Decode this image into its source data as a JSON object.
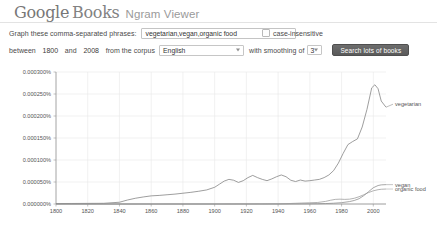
{
  "header": {
    "logo_google": "Google",
    "logo_books": "Books",
    "subtitle": "Ngram Viewer"
  },
  "query_row": {
    "label": "Graph these comma-separated phrases:",
    "input_value": "vegetarian,vegan,organic food",
    "input_placeholder": "",
    "case_insensitive_label": "case-insensitive",
    "case_insensitive_checked": false
  },
  "options_row": {
    "between_label": "between",
    "start_year": "1800",
    "and_label": "and",
    "end_year": "2008",
    "corpus_label": "from the corpus",
    "corpus_value": "English",
    "smoothing_label": "with smoothing of",
    "smoothing_value": "3",
    "search_button": "Search lots of books"
  },
  "chart_data": {
    "type": "line",
    "title": "",
    "xlabel": "",
    "ylabel": "",
    "grid": true,
    "legend_position": "right-inline",
    "xlim": [
      1800,
      2008
    ],
    "ylim": [
      0,
      0.0003
    ],
    "xticks": [
      1800,
      1820,
      1840,
      1860,
      1880,
      1900,
      1920,
      1940,
      1960,
      1980,
      2000
    ],
    "ytick_labels": [
      "0.000000%",
      "0.000050%",
      "0.000100%",
      "0.000150%",
      "0.000200%",
      "0.000250%",
      "0.000300%"
    ],
    "yticks": [
      0.0,
      5e-05,
      0.0001,
      0.00015,
      0.0002,
      0.00025,
      0.0003
    ],
    "series": [
      {
        "name": "vegetarian",
        "color": "#7d7d7d",
        "x": [
          1800,
          1810,
          1820,
          1830,
          1840,
          1845,
          1850,
          1855,
          1860,
          1865,
          1870,
          1875,
          1880,
          1885,
          1890,
          1895,
          1900,
          1903,
          1906,
          1909,
          1912,
          1915,
          1918,
          1921,
          1924,
          1927,
          1930,
          1933,
          1936,
          1939,
          1942,
          1945,
          1948,
          1951,
          1954,
          1957,
          1960,
          1963,
          1966,
          1969,
          1972,
          1975,
          1978,
          1981,
          1984,
          1987,
          1990,
          1993,
          1996,
          1999,
          2001,
          2003,
          2005,
          2008
        ],
        "y": [
          1e-06,
          1.2e-06,
          1.4e-06,
          1.6e-06,
          4e-06,
          9e-06,
          1.3e-05,
          1.6e-05,
          1.85e-05,
          1.95e-05,
          2.1e-05,
          2.25e-05,
          2.45e-05,
          2.65e-05,
          2.9e-05,
          3.2e-05,
          3.8e-05,
          4.5e-05,
          5.2e-05,
          5.6e-05,
          5.4e-05,
          4.9e-05,
          5.3e-05,
          6e-05,
          6.5e-05,
          6e-05,
          5.6e-05,
          5.3e-05,
          5.7e-05,
          6.2e-05,
          6.6e-05,
          6.2e-05,
          5.4e-05,
          5.1e-05,
          5.45e-05,
          5.2e-05,
          5.3e-05,
          5.45e-05,
          5.6e-05,
          6e-05,
          6.6e-05,
          7.6e-05,
          9.3e-05,
          0.000115,
          0.000135,
          0.000142,
          0.000148,
          0.000175,
          0.000215,
          0.000264,
          0.000271,
          0.000262,
          0.000234,
          0.00022
        ]
      },
      {
        "name": "vegan",
        "color": "#8a8a8a",
        "x": [
          1800,
          1900,
          1940,
          1950,
          1960,
          1965,
          1970,
          1975,
          1980,
          1985,
          1988,
          1991,
          1994,
          1997,
          2000,
          2003,
          2005,
          2008
        ],
        "y": [
          0.0,
          0.0,
          1e-07,
          2e-07,
          4e-07,
          6e-07,
          1e-06,
          1.8e-06,
          3e-06,
          5.5e-06,
          8e-06,
          1.2e-05,
          1.9e-05,
          2.8e-05,
          3.7e-05,
          4.2e-05,
          4.35e-05,
          4.4e-05
        ]
      },
      {
        "name": "organic food",
        "color": "#9a9a9a",
        "x": [
          1800,
          1900,
          1930,
          1940,
          1945,
          1950,
          1955,
          1960,
          1965,
          1970,
          1973,
          1976,
          1979,
          1982,
          1985,
          1988,
          1991,
          1994,
          1997,
          2000,
          2003,
          2005,
          2008
        ],
        "y": [
          0.0,
          1e-07,
          2e-07,
          4e-07,
          8e-07,
          1.5e-06,
          2.2e-06,
          2.8e-06,
          3.5e-06,
          6e-06,
          8.5e-06,
          1.05e-05,
          1.1e-05,
          1.05e-05,
          1.1e-05,
          1.3e-05,
          1.65e-05,
          2.1e-05,
          2.6e-05,
          3e-05,
          3.25e-05,
          3.35e-05,
          3.4e-05
        ]
      }
    ]
  }
}
